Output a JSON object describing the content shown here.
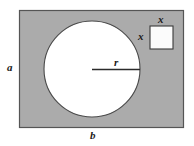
{
  "figure": {
    "canvas": {
      "width": 194,
      "height": 146,
      "background": "#ffffff"
    },
    "colors": {
      "plate_fill": "#ababab",
      "plate_stroke": "#555555",
      "hole_fill": "#ffffff",
      "hole_stroke": "#4a4a4a",
      "square_fill": "#fbfbfb",
      "square_stroke": "#3a3a3a",
      "radius_line": "#2b2b2b",
      "label_color": "#1a1a1a"
    },
    "shapes": {
      "plate": {
        "name": "outer-rectangle",
        "x": 19,
        "y": 10,
        "width": 165,
        "height": 118
      },
      "circle": {
        "name": "circular-hole",
        "cx": 92,
        "cy": 69,
        "r": 48
      },
      "square": {
        "name": "square-cutout",
        "x": 150,
        "y": 26,
        "width": 23,
        "height": 23
      },
      "radius_line": {
        "name": "radius-segment",
        "x1": 92,
        "y1": 69,
        "x2": 140,
        "y2": 69
      }
    },
    "labels": {
      "height": "a",
      "width": "b",
      "radius": "r",
      "square_side_top": "x",
      "square_side_left": "x"
    }
  }
}
